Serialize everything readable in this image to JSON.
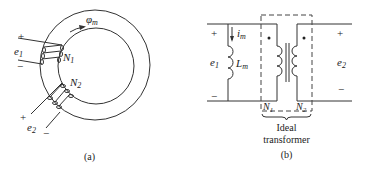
{
  "figure_a": {
    "caption": "(a)",
    "flux_label": "φ",
    "flux_sub": "m",
    "winding1": {
      "turns": "N",
      "turns_sub": "1",
      "voltage": "e",
      "voltage_sub": "1",
      "plus": "+",
      "minus": "−"
    },
    "winding2": {
      "turns": "N",
      "turns_sub": "2",
      "voltage": "e",
      "voltage_sub": "2",
      "plus": "+",
      "minus": "−"
    }
  },
  "figure_b": {
    "caption": "(b)",
    "current_label": "i",
    "current_sub": "m",
    "inductor_label": "L",
    "inductor_sub": "m",
    "primary": {
      "voltage": "e",
      "voltage_sub": "1",
      "plus": "+",
      "minus": "−",
      "turns": "N",
      "turns_sub": "1"
    },
    "secondary": {
      "voltage": "e",
      "voltage_sub": "2",
      "plus": "+",
      "minus": "−",
      "turns": "N",
      "turns_sub": "2"
    },
    "ideal_label_line1": "Ideal",
    "ideal_label_line2": "transformer"
  }
}
